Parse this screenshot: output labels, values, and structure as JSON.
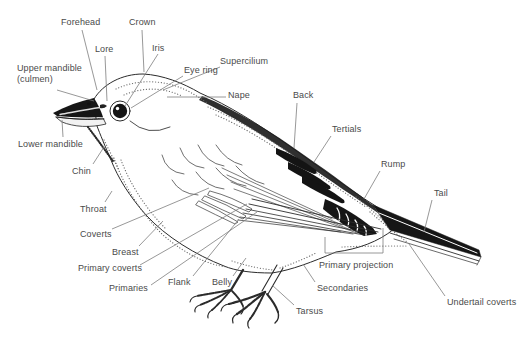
{
  "palette": {
    "background": "#ffffff",
    "label_text": "#4a4a4a",
    "leader_line": "#7d7d7d",
    "ink": "#161616"
  },
  "diagram": {
    "type": "bird-topography-illustration",
    "parts": [
      {
        "id": "forehead",
        "label": "Forehead"
      },
      {
        "id": "crown",
        "label": "Crown"
      },
      {
        "id": "lore",
        "label": "Lore"
      },
      {
        "id": "iris",
        "label": "Iris"
      },
      {
        "id": "upper-mandible",
        "label": "Upper mandible (culmen)"
      },
      {
        "id": "eye-ring",
        "label": "Eye ring"
      },
      {
        "id": "supercilium",
        "label": "Supercilium"
      },
      {
        "id": "nape",
        "label": "Nape"
      },
      {
        "id": "back",
        "label": "Back"
      },
      {
        "id": "lower-mandible",
        "label": "Lower mandible"
      },
      {
        "id": "tertials",
        "label": "Tertials"
      },
      {
        "id": "chin",
        "label": "Chin"
      },
      {
        "id": "rump",
        "label": "Rump"
      },
      {
        "id": "throat",
        "label": "Throat"
      },
      {
        "id": "tail",
        "label": "Tail"
      },
      {
        "id": "coverts",
        "label": "Coverts"
      },
      {
        "id": "breast",
        "label": "Breast"
      },
      {
        "id": "primary-coverts",
        "label": "Primary coverts"
      },
      {
        "id": "primaries",
        "label": "Primaries"
      },
      {
        "id": "flank",
        "label": "Flank"
      },
      {
        "id": "belly",
        "label": "Belly"
      },
      {
        "id": "primary-projection",
        "label": "Primary projection"
      },
      {
        "id": "secondaries",
        "label": "Secondaries"
      },
      {
        "id": "tarsus",
        "label": "Tarsus"
      },
      {
        "id": "undertail-coverts",
        "label": "Undertail coverts"
      }
    ]
  }
}
